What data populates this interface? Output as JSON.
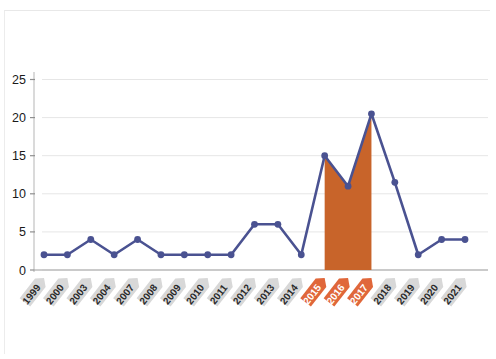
{
  "chart_data": {
    "type": "line",
    "title": "",
    "subtitle": "",
    "xlabel": "",
    "ylabel": "",
    "categories": [
      "1999",
      "2000",
      "2003",
      "2004",
      "2007",
      "2008",
      "2009",
      "2010",
      "2011",
      "2012",
      "2013",
      "2014",
      "2015",
      "2016",
      "2017",
      "2018",
      "2019",
      "2020",
      "2021"
    ],
    "values": [
      2,
      2,
      4,
      2,
      4,
      2,
      2,
      2,
      2,
      6,
      6,
      2,
      15,
      11,
      20.5,
      11.5,
      2,
      4,
      4
    ],
    "series": [
      {
        "name": "series-1",
        "values": [
          2,
          2,
          4,
          2,
          4,
          2,
          2,
          2,
          2,
          6,
          6,
          2,
          15,
          11,
          20.5,
          11.5,
          2,
          4,
          4
        ]
      }
    ],
    "ylim": [
      0,
      27
    ],
    "yticks": [
      0,
      5,
      10,
      15,
      20,
      25
    ],
    "ytick_labels": [
      "0",
      "5",
      "10",
      "15",
      "20",
      "25"
    ],
    "grid": true,
    "legend": "none",
    "highlight_categories": [
      "2015",
      "2016",
      "2017"
    ],
    "highlight_fill_note": "Area under the line is filled solid orange between 2015 and 2017",
    "colors": {
      "line": "#4a5291",
      "marker": "#4a5291",
      "highlight_fill": "#c8642a",
      "highlight_label_bg": "#e0673a",
      "normal_label_bg": "#d8d8d8",
      "axis": "#b5b5b5",
      "gridline": "#e6e6e6",
      "background": "#ffffff"
    }
  },
  "axis": {
    "y_tick_0": "0",
    "y_tick_1": "5",
    "y_tick_2": "10",
    "y_tick_3": "15",
    "y_tick_4": "20",
    "y_tick_5": "25"
  },
  "x_labels": [
    {
      "label": "1999",
      "highlight": false
    },
    {
      "label": "2000",
      "highlight": false
    },
    {
      "label": "2003",
      "highlight": false
    },
    {
      "label": "2004",
      "highlight": false
    },
    {
      "label": "2007",
      "highlight": false
    },
    {
      "label": "2008",
      "highlight": false
    },
    {
      "label": "2009",
      "highlight": false
    },
    {
      "label": "2010",
      "highlight": false
    },
    {
      "label": "2011",
      "highlight": false
    },
    {
      "label": "2012",
      "highlight": false
    },
    {
      "label": "2013",
      "highlight": false
    },
    {
      "label": "2014",
      "highlight": false
    },
    {
      "label": "2015",
      "highlight": true
    },
    {
      "label": "2016",
      "highlight": true
    },
    {
      "label": "2017",
      "highlight": true
    },
    {
      "label": "2018",
      "highlight": false
    },
    {
      "label": "2019",
      "highlight": false
    },
    {
      "label": "2020",
      "highlight": false
    },
    {
      "label": "2021",
      "highlight": false
    }
  ]
}
